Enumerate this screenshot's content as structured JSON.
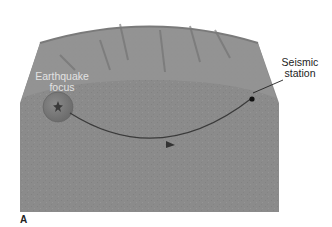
{
  "figure": {
    "panel_label": "A",
    "labels": {
      "focus": [
        "Earthquake",
        "focus"
      ],
      "station": [
        "Seismic",
        "station"
      ]
    },
    "colors": {
      "earth_body": "#8a8a8a",
      "surface": "#929292",
      "focus_sphere": "#7a7a7a",
      "ray_path": "#3a3a3a",
      "station_dot": "#111111"
    }
  }
}
